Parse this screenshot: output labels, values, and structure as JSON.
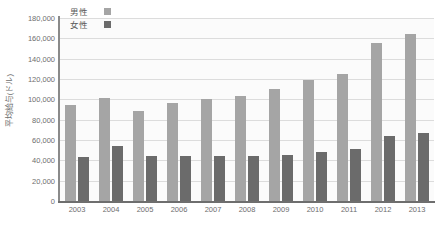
{
  "chart_data": {
    "type": "bar",
    "title": "",
    "xlabel": "",
    "ylabel": "平均給与(ドル)",
    "ylim": [
      0,
      180000
    ],
    "ytick_step": 20000,
    "grid": true,
    "legend_position": "top-left",
    "categories": [
      "2003",
      "2004",
      "2005",
      "2006",
      "2007",
      "2008",
      "2009",
      "2010",
      "2011",
      "2012",
      "2013"
    ],
    "ytick_labels": [
      "180,000",
      "160,000",
      "140,000",
      "120,000",
      "100,000",
      "80,000",
      "60,000",
      "40,000",
      "20,000",
      "0"
    ],
    "ytick_values": [
      180000,
      160000,
      140000,
      120000,
      100000,
      80000,
      60000,
      40000,
      20000,
      0
    ],
    "series": [
      {
        "name": "男性",
        "color": "#a5a5a5",
        "values": [
          94000,
          101000,
          89000,
          96000,
          100000,
          103000,
          110000,
          119000,
          125000,
          155000,
          164000
        ]
      },
      {
        "name": "女性",
        "color": "#6b6b6b",
        "values": [
          43000,
          54000,
          44000,
          44000,
          44000,
          44000,
          45500,
          48000,
          51000,
          63500,
          67000
        ]
      }
    ]
  }
}
